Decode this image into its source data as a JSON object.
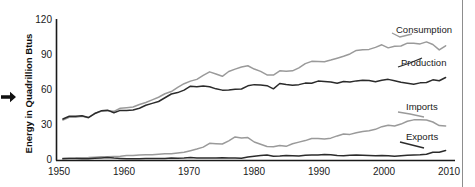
{
  "axes": {
    "ylabel": "Energy in Quadrillion Btus",
    "y_ticks": [
      "0",
      "30",
      "60",
      "90",
      "120"
    ],
    "x_ticks": [
      "1950",
      "1960",
      "1970",
      "1980",
      "1990",
      "2000",
      "2010"
    ]
  },
  "series_labels": {
    "consumption": "Consumption",
    "production": "Production",
    "imports": "Imports",
    "exports": "Exports"
  },
  "icons": {
    "pointer": "right-arrow-icon"
  },
  "colors": {
    "consumption": "#9a9a9a",
    "production": "#2b2b2b",
    "imports": "#9a9a9a",
    "exports": "#2b2b2b",
    "axis": "#1a1a1a",
    "border": "#8d8d8d"
  },
  "chart_data": {
    "type": "line",
    "title": "",
    "xlabel": "",
    "ylabel": "Energy in Quadrillion Btus",
    "xlim": [
      1949,
      2011
    ],
    "ylim": [
      0,
      120
    ],
    "y_ticks": [
      0,
      30,
      60,
      90,
      120
    ],
    "x_ticks": [
      1950,
      1960,
      1970,
      1980,
      1990,
      2000,
      2010
    ],
    "grid": false,
    "legend": "inline-right-labels",
    "x": [
      1950,
      1951,
      1952,
      1953,
      1954,
      1955,
      1956,
      1957,
      1958,
      1959,
      1960,
      1961,
      1962,
      1963,
      1964,
      1965,
      1966,
      1967,
      1968,
      1969,
      1970,
      1971,
      1972,
      1973,
      1974,
      1975,
      1976,
      1977,
      1978,
      1979,
      1980,
      1981,
      1982,
      1983,
      1984,
      1985,
      1986,
      1987,
      1988,
      1989,
      1990,
      1991,
      1992,
      1993,
      1994,
      1995,
      1996,
      1997,
      1998,
      1999,
      2000,
      2001,
      2002,
      2003,
      2004,
      2005,
      2006,
      2007,
      2008,
      2009,
      2010
    ],
    "series": [
      {
        "name": "Consumption",
        "color": "#9a9a9a",
        "values": [
          34.6,
          36.9,
          37.0,
          37.7,
          36.6,
          40.2,
          42.1,
          42.4,
          42.0,
          44.6,
          45.1,
          45.7,
          47.8,
          49.6,
          51.8,
          54.0,
          57.0,
          58.9,
          62.4,
          65.6,
          67.8,
          69.3,
          72.7,
          75.7,
          73.9,
          71.9,
          76.0,
          78.0,
          79.9,
          80.9,
          78.1,
          76.1,
          73.1,
          73.0,
          76.6,
          76.3,
          76.6,
          79.1,
          82.7,
          84.7,
          84.5,
          84.4,
          85.8,
          87.4,
          89.1,
          91.0,
          94.0,
          94.6,
          94.9,
          96.6,
          98.8,
          96.2,
          97.6,
          97.8,
          100.2,
          100.2,
          99.6,
          101.3,
          99.1,
          94.5,
          98.0
        ]
      },
      {
        "name": "Production",
        "color": "#2b2b2b",
        "values": [
          35.5,
          37.8,
          37.8,
          38.2,
          36.7,
          40.1,
          42.4,
          43.0,
          40.8,
          42.8,
          42.8,
          43.1,
          44.6,
          47.2,
          48.8,
          50.4,
          53.6,
          56.8,
          58.0,
          60.1,
          63.5,
          62.9,
          63.6,
          63.0,
          61.2,
          60.1,
          60.2,
          60.9,
          61.1,
          63.8,
          64.8,
          64.4,
          63.9,
          61.2,
          65.8,
          64.9,
          64.3,
          64.8,
          66.1,
          66.0,
          67.8,
          67.4,
          67.1,
          66.0,
          67.5,
          67.1,
          68.0,
          68.6,
          68.4,
          67.3,
          68.6,
          69.3,
          68.1,
          66.9,
          66.0,
          65.2,
          66.3,
          66.6,
          68.9,
          68.1,
          70.9
        ]
      },
      {
        "name": "Imports",
        "color": "#9a9a9a",
        "values": [
          1.9,
          2.0,
          2.1,
          2.4,
          2.5,
          2.8,
          3.1,
          3.2,
          3.4,
          3.6,
          4.2,
          4.3,
          4.6,
          4.9,
          5.0,
          5.4,
          5.7,
          5.7,
          6.4,
          7.1,
          8.4,
          9.8,
          11.4,
          14.7,
          14.4,
          14.1,
          16.8,
          20.1,
          19.3,
          19.6,
          15.8,
          13.9,
          12.0,
          11.7,
          12.9,
          12.1,
          14.3,
          15.7,
          17.0,
          18.8,
          18.8,
          18.3,
          19.1,
          21.0,
          22.6,
          22.3,
          23.7,
          24.8,
          25.5,
          26.6,
          28.9,
          30.1,
          29.4,
          31.1,
          33.5,
          34.7,
          34.7,
          34.6,
          32.9,
          29.8,
          29.5
        ]
      },
      {
        "name": "Exports",
        "color": "#2b2b2b",
        "values": [
          1.4,
          1.8,
          1.8,
          1.6,
          1.6,
          1.9,
          2.2,
          2.6,
          2.1,
          1.8,
          1.5,
          1.6,
          1.6,
          1.8,
          1.8,
          1.8,
          1.8,
          2.1,
          2.0,
          2.1,
          2.6,
          2.2,
          2.1,
          2.1,
          2.2,
          2.4,
          2.2,
          2.1,
          1.9,
          2.9,
          3.7,
          4.3,
          4.7,
          3.7,
          3.8,
          4.2,
          4.0,
          3.8,
          4.4,
          4.7,
          4.8,
          5.1,
          4.9,
          4.2,
          4.1,
          4.5,
          4.6,
          4.5,
          4.3,
          4.0,
          4.2,
          4.0,
          3.7,
          4.1,
          4.4,
          4.6,
          4.9,
          5.4,
          7.1,
          7.0,
          8.5
        ]
      }
    ],
    "annotations": [
      {
        "text": "Consumption",
        "series": "Consumption",
        "x": 2001,
        "y": 108
      },
      {
        "text": "Production",
        "series": "Production",
        "x": 2001,
        "y": 80
      },
      {
        "text": "Imports",
        "series": "Imports",
        "x": 2002,
        "y": 42
      },
      {
        "text": "Exports",
        "series": "Exports",
        "x": 2002,
        "y": 18
      }
    ]
  }
}
